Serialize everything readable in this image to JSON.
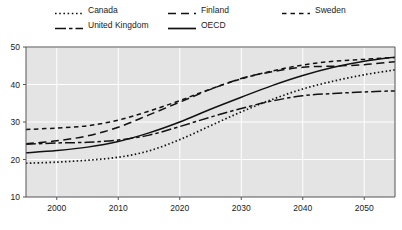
{
  "chart_data": {
    "type": "line",
    "title": "",
    "subtitle": "",
    "xlabel": "",
    "ylabel": "",
    "xlim": [
      1995,
      2055
    ],
    "ylim": [
      10,
      50
    ],
    "grid": true,
    "legend_position": "top",
    "xticks": [
      2000,
      2010,
      2020,
      2030,
      2040,
      2050
    ],
    "yticks": [
      10,
      20,
      30,
      40,
      50
    ],
    "x": [
      1995,
      2000,
      2005,
      2010,
      2015,
      2020,
      2025,
      2030,
      2035,
      2040,
      2045,
      2050,
      2055
    ],
    "series": [
      {
        "name": "Canada",
        "style": "dotted",
        "color": "#111111",
        "values": [
          19.0,
          19.3,
          19.8,
          20.6,
          22.3,
          25.3,
          29.0,
          32.7,
          36.0,
          38.8,
          40.9,
          42.6,
          43.9
        ]
      },
      {
        "name": "Finland",
        "style": "dashed",
        "color": "#111111",
        "values": [
          24.2,
          25.0,
          26.3,
          28.6,
          31.9,
          35.3,
          38.7,
          41.6,
          43.4,
          44.6,
          44.9,
          45.3,
          46.1
        ]
      },
      {
        "name": "Sweden",
        "style": "short-dashed",
        "color": "#111111",
        "values": [
          28.0,
          28.4,
          29.0,
          30.5,
          32.9,
          35.7,
          38.8,
          41.5,
          43.6,
          45.2,
          46.2,
          46.7,
          47.2
        ]
      },
      {
        "name": "United Kingdom",
        "style": "dash-dot",
        "color": "#111111",
        "values": [
          24.1,
          24.4,
          24.6,
          25.2,
          26.5,
          28.8,
          31.3,
          33.6,
          35.6,
          37.0,
          37.6,
          38.0,
          38.3
        ]
      },
      {
        "name": "OECD",
        "style": "solid",
        "color": "#111111",
        "values": [
          21.8,
          22.4,
          23.3,
          24.8,
          27.1,
          30.0,
          33.4,
          36.6,
          39.7,
          42.4,
          44.6,
          46.2,
          47.3
        ]
      }
    ]
  },
  "legend": {
    "items": [
      {
        "label": "Canada",
        "style": "dotted"
      },
      {
        "label": "Finland",
        "style": "dashed"
      },
      {
        "label": "Sweden",
        "style": "short-dashed"
      },
      {
        "label": "United Kingdom",
        "style": "dash-dot"
      },
      {
        "label": "OECD",
        "style": "solid"
      }
    ]
  },
  "axes": {
    "y_tick_labels": [
      "50",
      "40",
      "30",
      "20",
      "10"
    ],
    "x_tick_labels": [
      "2000",
      "2010",
      "2020",
      "2030",
      "2040",
      "2050"
    ]
  },
  "colors": {
    "plot_background": "#e4e4e4",
    "gridline": "#ffffff",
    "axis": "#555555",
    "line": "#111111",
    "text": "#1a1a1a",
    "page_background": "#ffffff"
  }
}
